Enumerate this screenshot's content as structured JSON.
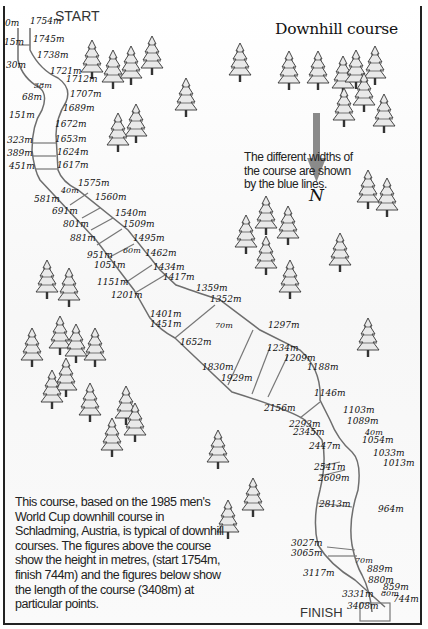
{
  "title": "Downhill course",
  "start_label": "START",
  "finish_label": "FINISH",
  "compass": {
    "label": "N",
    "direction": "down",
    "arrow_color": "#8a8a8a"
  },
  "note": "The different widths of the course are shown by the blue lines.",
  "description": "This course, based on the 1985 men's World Cup downhill course in Schladming, Austria, is typical of downhill courses. The figures above the course show the height in metres, (start 1754m, finish 744m) and the figures below show the length of the course (3408m) at particular points.",
  "colors": {
    "course_edge": "#6e6e6e",
    "width_marker": "#777777",
    "frame": "#222222"
  },
  "heights": [
    {
      "text": "1754m",
      "x": 30,
      "y": 24
    },
    {
      "text": "1745m",
      "x": 33,
      "y": 42
    },
    {
      "text": "1738m",
      "x": 37,
      "y": 58
    },
    {
      "text": "1721m",
      "x": 50,
      "y": 74
    },
    {
      "text": "1712m",
      "x": 66,
      "y": 82
    },
    {
      "text": "1707m",
      "x": 70,
      "y": 97
    },
    {
      "text": "1689m",
      "x": 63,
      "y": 111
    },
    {
      "text": "1672m",
      "x": 55,
      "y": 127
    },
    {
      "text": "1653m",
      "x": 55,
      "y": 142
    },
    {
      "text": "1624m",
      "x": 57,
      "y": 155
    },
    {
      "text": "1617m",
      "x": 57,
      "y": 168
    },
    {
      "text": "1575m",
      "x": 78,
      "y": 186
    },
    {
      "text": "1560m",
      "x": 95,
      "y": 200
    },
    {
      "text": "1540m",
      "x": 115,
      "y": 216
    },
    {
      "text": "1509m",
      "x": 123,
      "y": 227
    },
    {
      "text": "1495m",
      "x": 133,
      "y": 241
    },
    {
      "text": "1462m",
      "x": 145,
      "y": 256
    },
    {
      "text": "1434m",
      "x": 153,
      "y": 270
    },
    {
      "text": "1417m",
      "x": 163,
      "y": 280
    },
    {
      "text": "1359m",
      "x": 196,
      "y": 291
    },
    {
      "text": "1352m",
      "x": 210,
      "y": 302
    },
    {
      "text": "1297m",
      "x": 268,
      "y": 328
    },
    {
      "text": "1234m",
      "x": 267,
      "y": 351
    },
    {
      "text": "1209m",
      "x": 284,
      "y": 361
    },
    {
      "text": "1188m",
      "x": 307,
      "y": 370
    },
    {
      "text": "1146m",
      "x": 314,
      "y": 396
    },
    {
      "text": "1103m",
      "x": 343,
      "y": 413
    },
    {
      "text": "1089m",
      "x": 347,
      "y": 424
    },
    {
      "text": "1054m",
      "x": 362,
      "y": 443
    },
    {
      "text": "1033m",
      "x": 373,
      "y": 456
    },
    {
      "text": "1013m",
      "x": 383,
      "y": 466
    },
    {
      "text": "964m",
      "x": 378,
      "y": 512
    },
    {
      "text": "889m",
      "x": 367,
      "y": 572
    },
    {
      "text": "880m",
      "x": 368,
      "y": 583
    },
    {
      "text": "859m",
      "x": 383,
      "y": 590
    },
    {
      "text": "744m",
      "x": 393,
      "y": 602
    }
  ],
  "lengths": [
    {
      "text": "0m",
      "x": 5,
      "y": 26
    },
    {
      "text": "15m",
      "x": 4,
      "y": 45
    },
    {
      "text": "30m",
      "x": 6,
      "y": 68
    },
    {
      "text": "68m",
      "x": 22,
      "y": 100
    },
    {
      "text": "151m",
      "x": 9,
      "y": 118
    },
    {
      "text": "323m",
      "x": 7,
      "y": 143
    },
    {
      "text": "389m",
      "x": 7,
      "y": 156
    },
    {
      "text": "451m",
      "x": 9,
      "y": 169
    },
    {
      "text": "581m",
      "x": 34,
      "y": 202
    },
    {
      "text": "691m",
      "x": 52,
      "y": 214
    },
    {
      "text": "801m",
      "x": 63,
      "y": 227
    },
    {
      "text": "881m",
      "x": 70,
      "y": 241
    },
    {
      "text": "951m",
      "x": 87,
      "y": 258
    },
    {
      "text": "1051m",
      "x": 94,
      "y": 268
    },
    {
      "text": "1151m",
      "x": 97,
      "y": 285
    },
    {
      "text": "1201m",
      "x": 111,
      "y": 298
    },
    {
      "text": "1401m",
      "x": 150,
      "y": 317
    },
    {
      "text": "1451m",
      "x": 150,
      "y": 327
    },
    {
      "text": "1652m",
      "x": 180,
      "y": 345
    },
    {
      "text": "1830m",
      "x": 202,
      "y": 370
    },
    {
      "text": "1929m",
      "x": 221,
      "y": 381
    },
    {
      "text": "2156m",
      "x": 264,
      "y": 411
    },
    {
      "text": "2293m",
      "x": 289,
      "y": 427
    },
    {
      "text": "2345m",
      "x": 293,
      "y": 435
    },
    {
      "text": "2447m",
      "x": 309,
      "y": 449
    },
    {
      "text": "2541m",
      "x": 314,
      "y": 470
    },
    {
      "text": "2609m",
      "x": 318,
      "y": 481
    },
    {
      "text": "2813m",
      "x": 319,
      "y": 507
    },
    {
      "text": "3027m",
      "x": 291,
      "y": 546
    },
    {
      "text": "3065m",
      "x": 291,
      "y": 556
    },
    {
      "text": "3117m",
      "x": 303,
      "y": 576
    },
    {
      "text": "3331m",
      "x": 342,
      "y": 597
    },
    {
      "text": "3408m",
      "x": 347,
      "y": 609
    }
  ],
  "widths": [
    {
      "text": "38m",
      "x": 34,
      "y": 88
    },
    {
      "text": "40m",
      "x": 61,
      "y": 193
    },
    {
      "text": "60m",
      "x": 123,
      "y": 253
    },
    {
      "text": "70m",
      "x": 215,
      "y": 328
    },
    {
      "text": "40m",
      "x": 365,
      "y": 435
    },
    {
      "text": "70m",
      "x": 355,
      "y": 563
    },
    {
      "text": "80m",
      "x": 381,
      "y": 596
    }
  ]
}
